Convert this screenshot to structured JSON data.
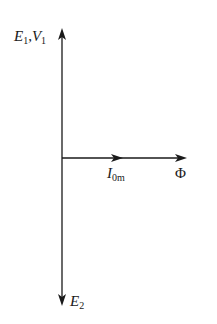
{
  "diagram": {
    "type": "phasor-diagram",
    "colors": {
      "line": "#1a1a1a",
      "background": "#ffffff"
    },
    "origin": {
      "x": 62,
      "y": 158
    },
    "vectors": [
      {
        "id": "E1V1",
        "direction": "up",
        "label_main": "E",
        "label_sub": "1",
        "label_sep": ",",
        "label_main2": "V",
        "label_sub2": "1"
      },
      {
        "id": "I0m",
        "direction": "right",
        "label_main": "I",
        "label_sub": "0m"
      },
      {
        "id": "Phi",
        "direction": "right",
        "label_main": "Φ"
      },
      {
        "id": "E2",
        "direction": "down",
        "label_main": "E",
        "label_sub": "2"
      }
    ]
  }
}
